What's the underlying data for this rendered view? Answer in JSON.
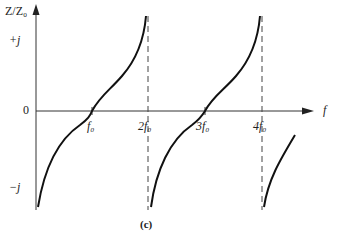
{
  "diagram": {
    "y_axis_label": "Z/Z₀",
    "x_axis_label": "f",
    "y_ticks": [
      {
        "label": "+j",
        "y": 41
      },
      {
        "label": "0",
        "y": 111
      },
      {
        "label": "−j",
        "y": 188
      }
    ],
    "x_ticks": [
      {
        "label": "f₀",
        "x": 92
      },
      {
        "label": "2f₀",
        "x": 148
      },
      {
        "label": "3f₀",
        "x": 205
      },
      {
        "label": "4f₀",
        "x": 262
      }
    ],
    "caption": "(c)",
    "colors": {
      "curve": "#111111",
      "axis": "#333333",
      "asymptote": "#444444"
    }
  }
}
